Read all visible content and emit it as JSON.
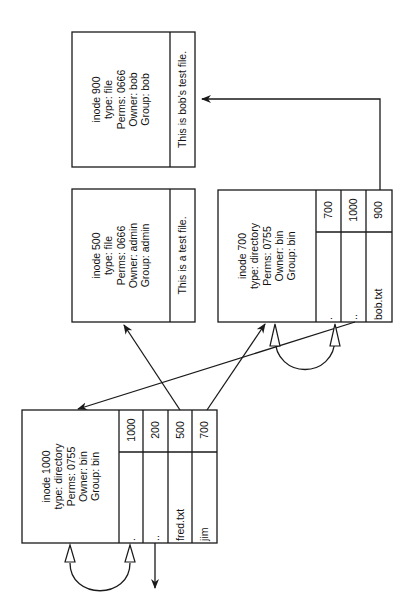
{
  "diagram": {
    "orientation": "rotated -90deg",
    "inodes": [
      {
        "id": "inode-900",
        "lines": [
          "inode 900",
          "type: file",
          "Perms: 0666",
          "Owner: bob",
          "Group: bob"
        ],
        "content": "This is bob's test file."
      },
      {
        "id": "inode-500",
        "lines": [
          "inode 500",
          "type: file",
          "Perms: 0666",
          "Owner: admin",
          "Group: admin"
        ],
        "content": "This is a test file."
      },
      {
        "id": "inode-700",
        "lines": [
          "inode 700",
          "type: directory",
          "Perms: 0755",
          "Owner: bin",
          "Group: bin"
        ],
        "entries": [
          {
            "name": ".",
            "inode": "700"
          },
          {
            "name": "..",
            "inode": "1000"
          },
          {
            "name": "bob.txt",
            "inode": "900"
          }
        ]
      },
      {
        "id": "inode-1000",
        "lines": [
          "inode 1000",
          "type: directory",
          "Perms: 0755",
          "Owner: bin",
          "Group: bin"
        ],
        "entries": [
          {
            "name": ".",
            "inode": "1000"
          },
          {
            "name": "..",
            "inode": "200"
          },
          {
            "name": "fred.txt",
            "inode": "500"
          },
          {
            "name": "jim",
            "inode": "700"
          }
        ]
      }
    ],
    "links": [
      {
        "from": "inode-1000 fred.txt",
        "to": "inode-500"
      },
      {
        "from": "inode-1000 jim",
        "to": "inode-700"
      },
      {
        "from": "inode-700 ..",
        "to": "inode-1000"
      },
      {
        "from": "inode-700 bob.txt",
        "to": "inode-900"
      },
      {
        "from": "inode-700 .",
        "to": "inode-700"
      },
      {
        "from": "inode-1000 .",
        "to": "inode-1000"
      },
      {
        "from": "inode-1000 ..",
        "to": "inode-200 (off-diagram)"
      }
    ]
  }
}
